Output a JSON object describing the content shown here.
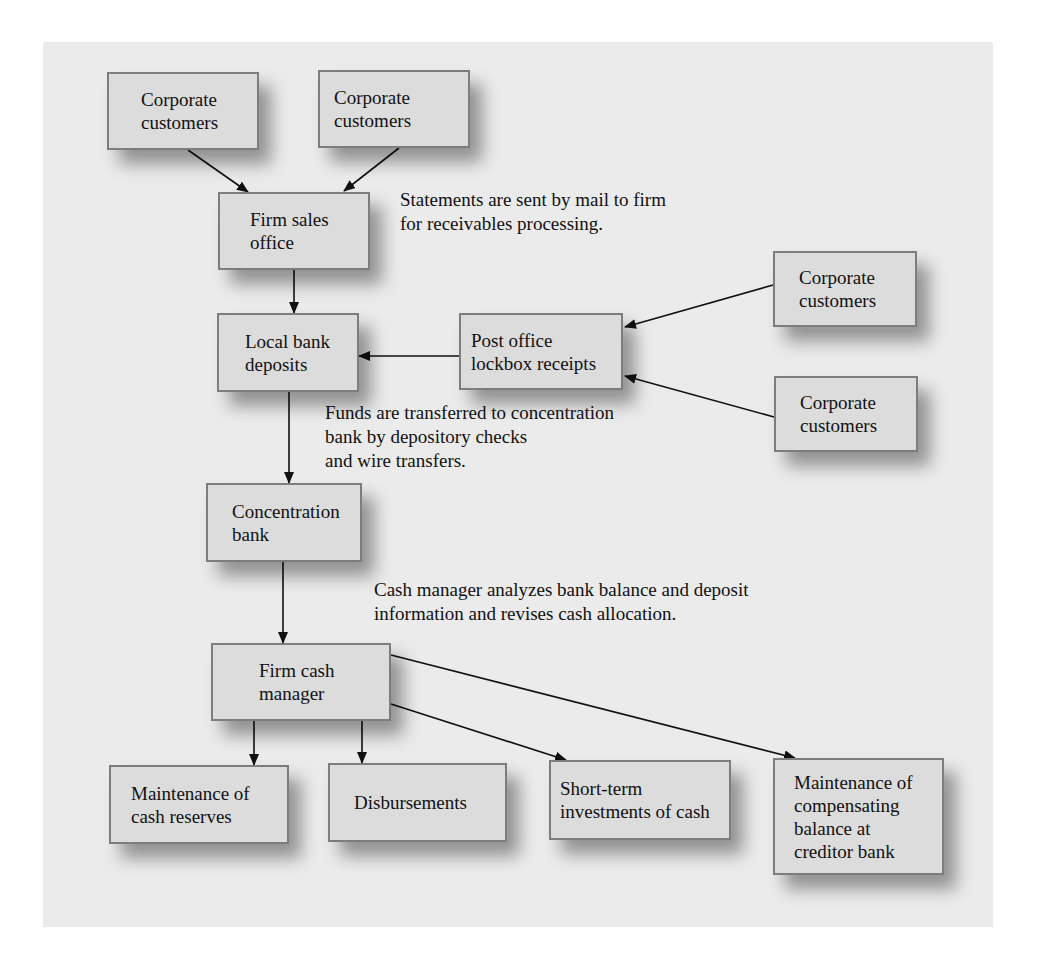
{
  "diagram": {
    "nodes": [
      {
        "id": "corp1",
        "label": "Corporate\ncustomers",
        "x": 107,
        "y": 72,
        "w": 152,
        "h": 78,
        "pad": 32
      },
      {
        "id": "corp2",
        "label": "Corporate\ncustomers",
        "x": 318,
        "y": 70,
        "w": 152,
        "h": 78,
        "pad": 14
      },
      {
        "id": "sales",
        "label": "Firm sales\noffice",
        "x": 218,
        "y": 192,
        "w": 152,
        "h": 78,
        "pad": 30
      },
      {
        "id": "local",
        "label": "Local bank\ndeposits",
        "x": 217,
        "y": 313,
        "w": 142,
        "h": 79,
        "pad": 26
      },
      {
        "id": "lockbox",
        "label": "Post office\nlockbox receipts",
        "x": 459,
        "y": 313,
        "w": 164,
        "h": 77,
        "pad": 10
      },
      {
        "id": "corp3",
        "label": "Corporate\ncustomers",
        "x": 773,
        "y": 251,
        "w": 144,
        "h": 76,
        "pad": 24
      },
      {
        "id": "corp4",
        "label": "Corporate\ncustomers",
        "x": 774,
        "y": 376,
        "w": 144,
        "h": 76,
        "pad": 24
      },
      {
        "id": "conc",
        "label": "Concentration\nbank",
        "x": 206,
        "y": 483,
        "w": 156,
        "h": 79,
        "pad": 24
      },
      {
        "id": "cashmgr",
        "label": "Firm cash\nmanager",
        "x": 211,
        "y": 643,
        "w": 180,
        "h": 78,
        "pad": 46
      },
      {
        "id": "reserves",
        "label": "Maintenance of\ncash reserves",
        "x": 109,
        "y": 765,
        "w": 180,
        "h": 79,
        "pad": 20
      },
      {
        "id": "disb",
        "label": "Disbursements",
        "x": 328,
        "y": 763,
        "w": 179,
        "h": 79,
        "pad": 24
      },
      {
        "id": "shortterm",
        "label": "Short-term\ninvestments of cash",
        "x": 549,
        "y": 760,
        "w": 182,
        "h": 80,
        "pad": 9
      },
      {
        "id": "comp",
        "label": "Maintenance of\ncompensating\nbalance at\ncreditor bank",
        "x": 773,
        "y": 758,
        "w": 171,
        "h": 117,
        "pad": 19
      }
    ],
    "notes": [
      {
        "id": "note-statements",
        "text": "Statements are sent by mail to firm\nfor receivables processing.",
        "x": 400,
        "y": 188
      },
      {
        "id": "note-funds",
        "text": "Funds are transferred to concentration\nbank by depository checks\nand wire transfers.",
        "x": 325,
        "y": 401
      },
      {
        "id": "note-cash-manager",
        "text": "Cash manager analyzes bank balance and deposit\ninformation and revises cash allocation.",
        "x": 374,
        "y": 578
      }
    ],
    "edges": [
      {
        "from": "corp1",
        "to": "sales",
        "x1": 188,
        "y1": 150,
        "x2": 248,
        "y2": 192
      },
      {
        "from": "corp2",
        "to": "sales",
        "x1": 399,
        "y1": 148,
        "x2": 344,
        "y2": 191
      },
      {
        "from": "sales",
        "to": "local",
        "x1": 294,
        "y1": 270,
        "x2": 294,
        "y2": 313
      },
      {
        "from": "lockbox",
        "to": "local",
        "x1": 459,
        "y1": 356,
        "x2": 359,
        "y2": 356
      },
      {
        "from": "corp3",
        "to": "lockbox",
        "x1": 773,
        "y1": 285,
        "x2": 625,
        "y2": 327
      },
      {
        "from": "corp4",
        "to": "lockbox",
        "x1": 774,
        "y1": 417,
        "x2": 625,
        "y2": 376
      },
      {
        "from": "local",
        "to": "conc",
        "x1": 289,
        "y1": 392,
        "x2": 289,
        "y2": 483
      },
      {
        "from": "conc",
        "to": "cashmgr",
        "x1": 283,
        "y1": 562,
        "x2": 283,
        "y2": 643
      },
      {
        "from": "cashmgr",
        "to": "reserves",
        "x1": 254,
        "y1": 721,
        "x2": 254,
        "y2": 765
      },
      {
        "from": "cashmgr",
        "to": "disb",
        "x1": 362,
        "y1": 721,
        "x2": 362,
        "y2": 763
      },
      {
        "from": "cashmgr",
        "to": "shortterm",
        "x1": 391,
        "y1": 704,
        "x2": 566,
        "y2": 760
      },
      {
        "from": "cashmgr",
        "to": "comp",
        "x1": 391,
        "y1": 655,
        "x2": 795,
        "y2": 758
      }
    ],
    "colors": {
      "panel": "#ebebeb",
      "box_fill": "#dcdcdc",
      "box_border": "#7d7d7d",
      "arrow": "#111111"
    }
  }
}
